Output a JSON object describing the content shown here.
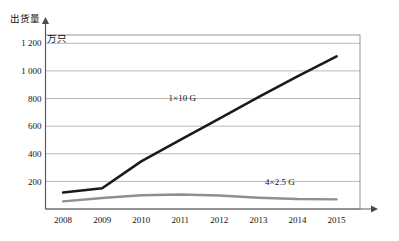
{
  "chart_data": {
    "type": "line",
    "title": "",
    "xlabel": "",
    "ylabel": "出货量",
    "yunit": "万只",
    "categories": [
      "2008",
      "2009",
      "2010",
      "2011",
      "2012",
      "2013",
      "2014",
      "2015"
    ],
    "x": [
      2008,
      2009,
      2010,
      2011,
      2012,
      2013,
      2014,
      2015
    ],
    "ylim": [
      0,
      1260
    ],
    "xlim": [
      2007.55,
      2015.6
    ],
    "yticks": [
      200,
      400,
      600,
      800,
      1000,
      1200
    ],
    "ytick_labels": [
      "200",
      "400",
      "600",
      "800",
      "1 000",
      "1 200"
    ],
    "grid": "horizontal",
    "legend": "inline-annotations",
    "series": [
      {
        "name": "1×10 G",
        "color": "#1a1a1a",
        "width": 2.6,
        "values": [
          120,
          150,
          345,
          500,
          655,
          810,
          960,
          1105
        ],
        "label_x": 2011.05,
        "label_y": 780
      },
      {
        "name": "4×2.5 G",
        "color": "#8f8f8f",
        "width": 2.4,
        "values": [
          55,
          80,
          100,
          105,
          98,
          82,
          72,
          70
        ],
        "label_x": 2013.55,
        "label_y": 175
      }
    ],
    "annotations": [
      {
        "text": "1×10 G",
        "x": 2011.05,
        "y": 780
      },
      {
        "text": "4×2.5 G",
        "x": 2013.55,
        "y": 175
      }
    ]
  },
  "watermark": {
    "text": ""
  }
}
